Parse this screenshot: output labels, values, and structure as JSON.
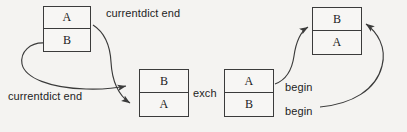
{
  "diagram": {
    "background_color": "#f4f3f1",
    "line_color": "#3b3b3b",
    "text_color": "#1d1d1d",
    "boxes": [
      {
        "id": "box-top-left",
        "top_cell": "A",
        "bottom_cell": "B",
        "x": 43,
        "y": 6,
        "width": 48,
        "height": 46
      },
      {
        "id": "box-middle",
        "top_cell": "B",
        "bottom_cell": "A",
        "x": 139,
        "y": 69,
        "width": 50,
        "height": 48
      },
      {
        "id": "box-right-lower",
        "top_cell": "A",
        "bottom_cell": "B",
        "x": 224,
        "y": 69,
        "width": 50,
        "height": 48
      },
      {
        "id": "box-top-right",
        "top_cell": "B",
        "bottom_cell": "A",
        "x": 312,
        "y": 7,
        "width": 50,
        "height": 48
      }
    ],
    "labels": [
      {
        "id": "label-currentdict-end-top",
        "text": "currentdict end",
        "x": 106,
        "y": 7
      },
      {
        "id": "label-currentdict-end-bottom",
        "text": "currentdict end",
        "x": 8,
        "y": 90
      },
      {
        "id": "label-exch",
        "text": "exch",
        "x": 193,
        "y": 87
      },
      {
        "id": "label-begin-upper",
        "text": "begin",
        "x": 285,
        "y": 81
      },
      {
        "id": "label-begin-lower",
        "text": "begin",
        "x": 285,
        "y": 105
      }
    ],
    "arrows": [
      {
        "id": "arrow-a-to-middle-top",
        "from": "box-top-left right side near A cell",
        "to": "box-middle top cell B",
        "label": "currentdict end"
      },
      {
        "id": "arrow-b-to-middle-bottom",
        "from": "box-top-left left side near B cell",
        "to": "box-middle bottom cell A",
        "label": "currentdict end"
      },
      {
        "id": "arrow-a-to-topright-left",
        "from": "box-right-lower top cell A",
        "to": "box-top-right bottom cell A",
        "label": "begin"
      },
      {
        "id": "arrow-b-to-topright-right",
        "from": "box-right-lower bottom cell B",
        "to": "box-top-right right side near B cell",
        "label": "begin"
      }
    ]
  }
}
